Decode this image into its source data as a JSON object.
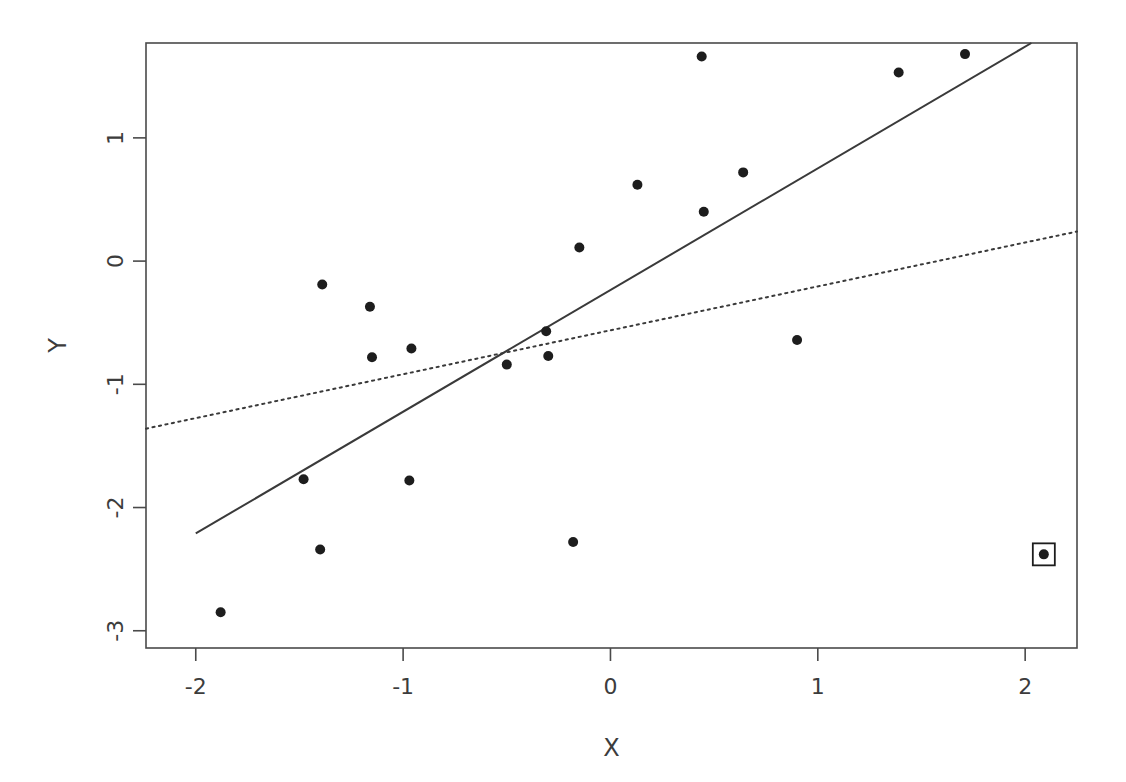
{
  "chart_data": {
    "type": "scatter",
    "title": "",
    "subtitle": "",
    "xlabel": "X",
    "ylabel": "Y",
    "xlim": [
      -2.24,
      2.25
    ],
    "ylim": [
      -3.14,
      1.77
    ],
    "xticks": [
      -2,
      -1,
      0,
      1,
      2
    ],
    "xticklabels": [
      "-2",
      "-1",
      "0",
      "1",
      "2"
    ],
    "yticks": [
      1,
      0,
      -1,
      -2,
      -3
    ],
    "yticklabels": [
      "1",
      "0",
      "-1",
      "-2",
      "-3"
    ],
    "grid": false,
    "legend": null,
    "points": [
      {
        "x": -1.88,
        "y": -2.85
      },
      {
        "x": -1.48,
        "y": -1.77
      },
      {
        "x": -1.4,
        "y": -2.34
      },
      {
        "x": -1.39,
        "y": -0.19
      },
      {
        "x": -1.16,
        "y": -0.37
      },
      {
        "x": -1.15,
        "y": -0.78
      },
      {
        "x": -0.97,
        "y": -1.78
      },
      {
        "x": -0.96,
        "y": -0.71
      },
      {
        "x": -0.5,
        "y": -0.84
      },
      {
        "x": -0.31,
        "y": -0.57
      },
      {
        "x": -0.3,
        "y": -0.77
      },
      {
        "x": -0.18,
        "y": -2.28
      },
      {
        "x": -0.15,
        "y": 0.11
      },
      {
        "x": 0.13,
        "y": 0.62
      },
      {
        "x": 0.44,
        "y": 1.66
      },
      {
        "x": 0.45,
        "y": 0.4
      },
      {
        "x": 0.64,
        "y": 0.72
      },
      {
        "x": 0.9,
        "y": -0.64
      },
      {
        "x": 1.39,
        "y": 1.53
      },
      {
        "x": 1.71,
        "y": 1.68
      }
    ],
    "highlighted_points": [
      {
        "x": 2.09,
        "y": -2.38,
        "marker": "boxed-point"
      }
    ],
    "lines": [
      {
        "name": "solid-fit-line",
        "style": "solid",
        "x": [
          -2.0,
          2.03
        ],
        "y": [
          -2.21,
          1.77
        ]
      },
      {
        "name": "dotted-fit-line",
        "style": "dotted",
        "x": [
          -2.24,
          2.25
        ],
        "y": [
          -1.36,
          0.24
        ]
      }
    ]
  },
  "axes": {
    "x_title": "X",
    "y_title": "Y"
  }
}
